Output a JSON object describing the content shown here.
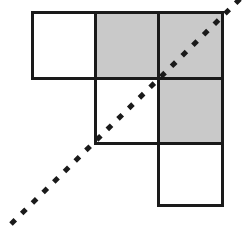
{
  "figure": {
    "type": "grid-diagram",
    "canvas": {
      "width": 244,
      "height": 244,
      "background": "#ffffff"
    },
    "grid": {
      "origin_x": 32,
      "origin_y": 12,
      "cell_width": 63,
      "cell_height": 65.5,
      "columns": 3,
      "rows": 3,
      "stroke_color": "#1a1a1a",
      "stroke_width": 3,
      "shaded_fill": "#c9c9c9",
      "empty_fill": "#ffffff"
    },
    "cells": [
      {
        "name": "cell-r1c1",
        "row": 1,
        "col": 1,
        "x": 32,
        "y": 12,
        "w": 63,
        "h": 66,
        "shaded": false
      },
      {
        "name": "cell-r1c2",
        "row": 1,
        "col": 2,
        "x": 95,
        "y": 12,
        "w": 63,
        "h": 66,
        "shaded": true
      },
      {
        "name": "cell-r1c3",
        "row": 1,
        "col": 3,
        "x": 158,
        "y": 12,
        "w": 64,
        "h": 66,
        "shaded": true
      },
      {
        "name": "cell-r2c2",
        "row": 2,
        "col": 2,
        "x": 95,
        "y": 78,
        "w": 63,
        "h": 65,
        "shaded": false
      },
      {
        "name": "cell-r2c3",
        "row": 2,
        "col": 3,
        "x": 158,
        "y": 78,
        "w": 64,
        "h": 65,
        "shaded": true
      },
      {
        "name": "cell-r3c3",
        "row": 3,
        "col": 3,
        "x": 158,
        "y": 143,
        "w": 64,
        "h": 62,
        "shaded": false
      }
    ],
    "diagonal": {
      "name": "dashed-diagonal",
      "x1": 11,
      "y1": 224,
      "x2": 241,
      "y2": -2,
      "color": "#1a1a1a",
      "stroke_width": 5,
      "dash_pattern": "6 9",
      "slope_degrees": 45
    },
    "axis_label": {
      "text": "y",
      "x": -4,
      "y": 96,
      "clipped": true
    }
  }
}
